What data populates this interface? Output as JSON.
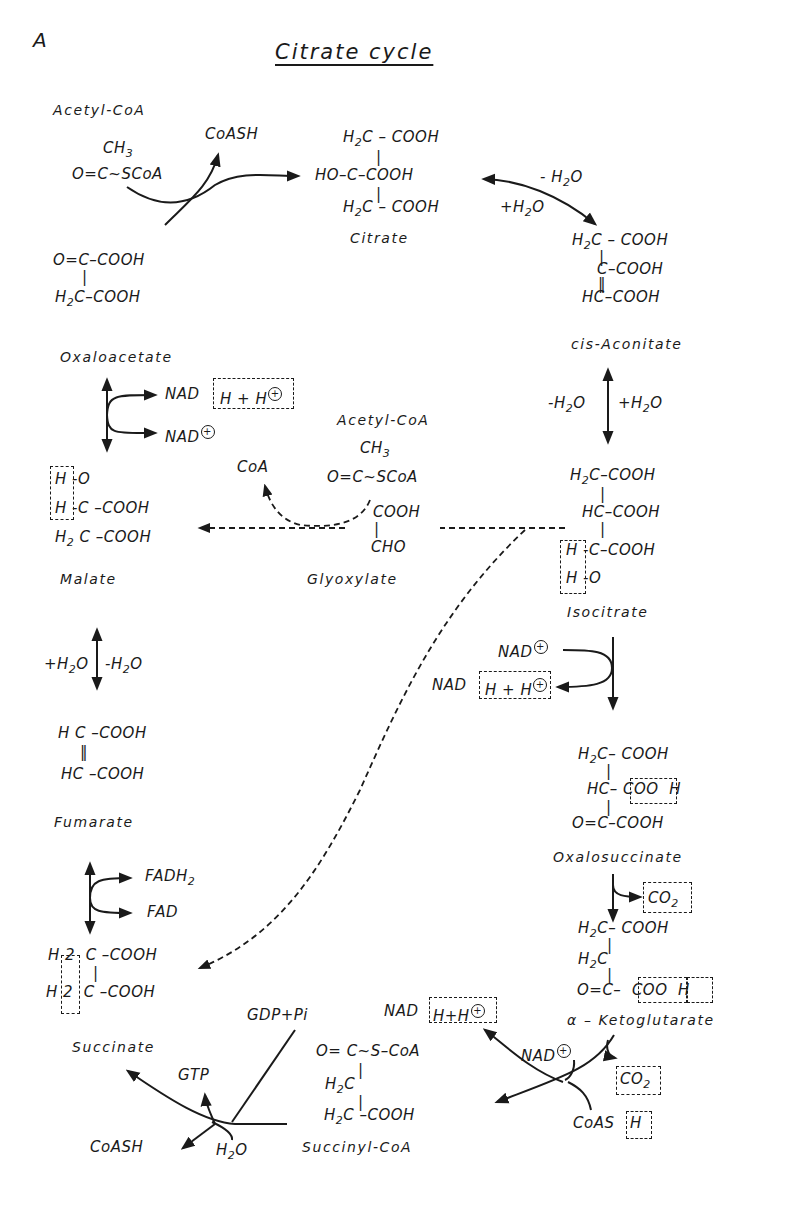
{
  "figure": {
    "panel_label": "A",
    "title": "Citrate cycle"
  },
  "compounds": {
    "acetyl_coa_top": {
      "name": "Acetyl-CoA",
      "formula": [
        "CH3",
        "O=C~SCoA"
      ]
    },
    "oxaloacetate_struct": {
      "formula": [
        "O=C–COOH",
        "H2C–COOH"
      ]
    },
    "oxaloacetate": {
      "name": "Oxaloacetate"
    },
    "citrate": {
      "name": "Citrate",
      "formula": [
        "H2C–COOH",
        "HO–C–COOH",
        "H2C–COOH"
      ]
    },
    "cis_aconitate": {
      "name": "cis-Aconitate",
      "formula": [
        "H2C–COOH",
        "C–COOH",
        "HC–COOH"
      ]
    },
    "isocitrate": {
      "name": "Isocitrate",
      "formula": [
        "H2C–COOH",
        "HC–COOH",
        "H–C–COOH",
        "H–O"
      ]
    },
    "malate": {
      "name": "Malate",
      "formula": [
        "H–O",
        "H–C–COOH",
        "H2C–COOH"
      ]
    },
    "acetyl_coa_glyox": {
      "name": "Acetyl-CoA",
      "formula": [
        "CH3",
        "O=C~SCoA"
      ]
    },
    "glyoxylate": {
      "name": "Glyoxylate",
      "formula": [
        "COOH",
        "CHO"
      ]
    },
    "fumarate": {
      "name": "Fumarate",
      "formula": [
        "HC–COOH",
        "HC–COOH"
      ]
    },
    "oxalosuccinate": {
      "name": "Oxalosuccinate",
      "formula": [
        "H2C–COOH",
        "HC–COO H",
        "O=C–COOH"
      ]
    },
    "alpha_ketoglutarate": {
      "name": "α – Ketoglutarate",
      "formula": [
        "H2C–COOH",
        "H2C",
        "O=C– COO H"
      ]
    },
    "succinyl_coa": {
      "name": "Succinyl-CoA",
      "formula": [
        "O= C~S–CoA",
        "H2C",
        "H2C–COOH"
      ]
    },
    "succinate": {
      "name": "Succinate",
      "formula": [
        "H2 C–COOH",
        "H2 C–COOH"
      ]
    }
  },
  "reaction_labels": {
    "coash_release": "CoASH",
    "citrate_minus_h2o": "-H2O",
    "citrate_plus_h2o": "+H2O",
    "aconitate_minus_h2o": "-H2O",
    "aconitate_plus_h2o": "+H2O",
    "malate_nad": "NAD",
    "malate_nadh": "H + H",
    "malate_nad_plus": "NAD",
    "glyox_coa": "CoA",
    "fumarate_plus_h2o": "+H2O",
    "fumarate_minus_h2o": "-H2O",
    "fadh2": "FADH",
    "fad": "FAD",
    "iso_nad_plus": "NAD",
    "iso_nad": "NAD",
    "iso_nadh": "H + H",
    "co2_1": "CO",
    "co2_2": "CO",
    "kg_nad_plus": "NAD",
    "kg_nad": "NAD",
    "kg_nadh": "H+H",
    "kg_coas": "CoAS",
    "kg_coas_h": "H",
    "gdp_pi": "GDP+Pi",
    "gtp": "GTP",
    "succ_coash": "CoASH",
    "h2o": "H2O"
  }
}
